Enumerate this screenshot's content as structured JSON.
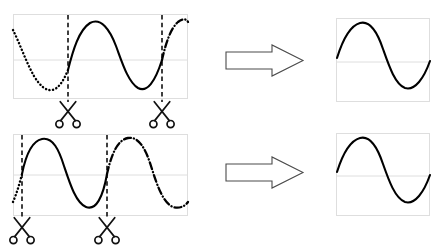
{
  "figure": {
    "background_color": "#ffffff",
    "width": 438,
    "height": 247,
    "stroke_color": "#000000",
    "grid_color": "#dedede",
    "arrow_fill": "#ffffff",
    "arrow_stroke": "#4a4a4a"
  },
  "chart_data": {
    "type": "line",
    "xlabel": "",
    "ylabel": "",
    "grid": true,
    "legend": "none",
    "panels": [
      {
        "id": "row1-source",
        "role": "source",
        "row": 1,
        "xlim": [
          0,
          1
        ],
        "ylim": [
          -1.35,
          1.35
        ],
        "gridlines_y": [
          0
        ],
        "cut_positions_x": [
          0.314,
          0.851
        ],
        "series": [
          {
            "name": "pre-cut segment",
            "style": "dotted",
            "x": [
              0.0,
              0.04,
              0.08,
              0.12,
              0.16,
              0.2,
              0.24,
              0.28,
              0.314
            ],
            "y": [
              0.72,
              0.2,
              -0.33,
              -0.75,
              -0.96,
              -0.9,
              -0.6,
              -0.14,
              0.15
            ]
          },
          {
            "name": "extracted segment",
            "style": "solid",
            "x": [
              0.314,
              0.36,
              0.4,
              0.44,
              0.48,
              0.52,
              0.56,
              0.6,
              0.64,
              0.68,
              0.72,
              0.76,
              0.8,
              0.851
            ],
            "y": [
              0.15,
              0.72,
              0.96,
              1.0,
              0.86,
              0.5,
              0.02,
              -0.5,
              -0.85,
              -1.0,
              -0.92,
              -0.6,
              -0.12,
              0.62
            ]
          },
          {
            "name": "post-cut segment",
            "style": "dash-dot",
            "x": [
              0.851,
              0.89,
              0.93,
              0.97,
              1.0
            ],
            "y": [
              0.62,
              0.92,
              1.02,
              1.0,
              0.92
            ]
          }
        ]
      },
      {
        "id": "row1-result",
        "role": "result",
        "row": 1,
        "xlim": [
          0,
          1
        ],
        "ylim": [
          -1.35,
          1.35
        ],
        "gridlines_y": [
          0
        ],
        "series": [
          {
            "name": "extracted segment",
            "style": "solid",
            "x": [
              0.0,
              0.06,
              0.13,
              0.2,
              0.28,
              0.36,
              0.44,
              0.52,
              0.6,
              0.68,
              0.76,
              0.85,
              0.93,
              1.0
            ],
            "y": [
              0.12,
              0.55,
              0.88,
              1.0,
              0.92,
              0.62,
              0.2,
              -0.3,
              -0.72,
              -0.96,
              -0.95,
              -0.68,
              -0.3,
              0.06
            ]
          }
        ]
      },
      {
        "id": "row2-source",
        "role": "source",
        "row": 2,
        "xlim": [
          0,
          1
        ],
        "ylim": [
          -1.35,
          1.35
        ],
        "gridlines_y": [
          0
        ],
        "cut_positions_x": [
          0.052,
          0.537
        ],
        "series": [
          {
            "name": "pre-cut segment",
            "style": "dotted",
            "x": [
              0.0,
              0.016,
              0.032,
              0.052
            ],
            "y": [
              -0.75,
              -0.52,
              -0.25,
              0.05
            ]
          },
          {
            "name": "extracted segment",
            "style": "solid",
            "x": [
              0.052,
              0.09,
              0.13,
              0.17,
              0.21,
              0.25,
              0.29,
              0.33,
              0.37,
              0.41,
              0.45,
              0.49,
              0.537
            ],
            "y": [
              0.05,
              0.62,
              0.92,
              1.0,
              0.88,
              0.58,
              0.12,
              -0.42,
              -0.8,
              -1.0,
              -0.95,
              -0.66,
              0.1
            ]
          },
          {
            "name": "post-cut segment",
            "style": "dash-dot",
            "x": [
              0.537,
              0.58,
              0.62,
              0.66,
              0.7,
              0.74,
              0.78,
              0.82,
              0.86,
              0.9,
              0.94,
              0.97,
              1.0
            ],
            "y": [
              0.1,
              0.68,
              0.92,
              1.0,
              0.9,
              0.6,
              0.18,
              -0.3,
              -0.7,
              -0.92,
              -0.95,
              -0.82,
              -0.6
            ]
          }
        ]
      },
      {
        "id": "row2-result",
        "role": "result",
        "row": 2,
        "xlim": [
          0,
          1
        ],
        "ylim": [
          -1.35,
          1.35
        ],
        "gridlines_y": [
          0
        ],
        "series": [
          {
            "name": "extracted segment",
            "style": "solid",
            "x": [
              0.0,
              0.06,
              0.13,
              0.2,
              0.28,
              0.36,
              0.44,
              0.52,
              0.6,
              0.68,
              0.76,
              0.85,
              0.93,
              1.0
            ],
            "y": [
              0.12,
              0.55,
              0.88,
              1.0,
              0.92,
              0.62,
              0.2,
              -0.3,
              -0.72,
              -0.96,
              -0.95,
              -0.68,
              -0.3,
              0.06
            ]
          }
        ]
      }
    ],
    "markers": [
      {
        "id": "row1-cut1",
        "icon": "scissors-icon",
        "row": 1,
        "x": 0.314
      },
      {
        "id": "row1-cut2",
        "icon": "scissors-icon",
        "row": 1,
        "x": 0.851
      },
      {
        "id": "row2-cut1",
        "icon": "scissors-icon",
        "row": 2,
        "x": 0.052
      },
      {
        "id": "row2-cut2",
        "icon": "scissors-icon",
        "row": 2,
        "x": 0.537
      }
    ],
    "arrows": [
      {
        "id": "row1-arrow",
        "icon": "arrow-right-icon",
        "row": 1,
        "direction": "right"
      },
      {
        "id": "row2-arrow",
        "icon": "arrow-right-icon",
        "row": 2,
        "direction": "right"
      }
    ]
  }
}
